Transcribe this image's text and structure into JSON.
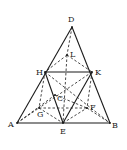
{
  "diagram": {
    "type": "geometry-figure",
    "points": {
      "D": {
        "x": 72,
        "y": 27,
        "label": "D",
        "lx": 68,
        "ly": 22
      },
      "L": {
        "x": 67,
        "y": 55,
        "label": "L",
        "lx": 70,
        "ly": 57
      },
      "H": {
        "x": 45,
        "y": 72,
        "label": "H",
        "lx": 36,
        "ly": 75
      },
      "K": {
        "x": 92,
        "y": 72,
        "label": "K",
        "lx": 95,
        "ly": 75
      },
      "C": {
        "x": 55,
        "y": 95,
        "label": "C",
        "lx": 57,
        "ly": 101
      },
      "F": {
        "x": 87,
        "y": 108,
        "label": "F",
        "lx": 90,
        "ly": 110
      },
      "G": {
        "x": 39,
        "y": 108,
        "label": "G",
        "lx": 37,
        "ly": 117
      },
      "A": {
        "x": 17,
        "y": 123,
        "label": "A",
        "lx": 8,
        "ly": 127
      },
      "E": {
        "x": 63,
        "y": 123,
        "label": "E",
        "lx": 60,
        "ly": 134
      },
      "B": {
        "x": 110,
        "y": 123,
        "label": "B",
        "lx": 112,
        "ly": 128
      }
    },
    "solid_segments": [
      [
        "D",
        "A"
      ],
      [
        "D",
        "B"
      ],
      [
        "A",
        "B"
      ],
      [
        "H",
        "K"
      ],
      [
        "H",
        "E"
      ],
      [
        "K",
        "E"
      ]
    ],
    "dashed_segments": [
      [
        "D",
        "L"
      ],
      [
        "L",
        "H"
      ],
      [
        "L",
        "K"
      ],
      [
        "L",
        "E"
      ],
      [
        "H",
        "G"
      ],
      [
        "H",
        "B"
      ],
      [
        "K",
        "F"
      ],
      [
        "K",
        "G"
      ],
      [
        "A",
        "C"
      ],
      [
        "C",
        "F"
      ],
      [
        "G",
        "F"
      ],
      [
        "G",
        "E"
      ],
      [
        "E",
        "F"
      ],
      [
        "F",
        "B"
      ],
      [
        "A",
        "G"
      ]
    ]
  }
}
